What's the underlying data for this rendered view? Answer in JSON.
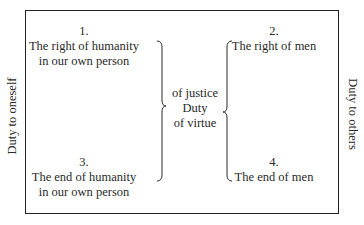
{
  "diagram": {
    "side_labels": {
      "left": "Duty to oneself",
      "right": "Duty to others"
    },
    "quadrants": [
      {
        "number": "1.",
        "lines": [
          "The right of humanity",
          "in our own person"
        ]
      },
      {
        "number": "2.",
        "lines": [
          "The right of men"
        ]
      },
      {
        "number": "3.",
        "lines": [
          "The end of humanity",
          "in our own person"
        ]
      },
      {
        "number": "4.",
        "lines": [
          "The end of men"
        ]
      }
    ],
    "center": {
      "lines": [
        "of justice",
        "Duty",
        "of virtue"
      ]
    },
    "colors": {
      "text": "#2a2a2a",
      "border": "#222222",
      "background": "#ffffff"
    }
  }
}
